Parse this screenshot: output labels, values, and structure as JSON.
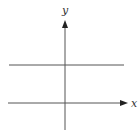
{
  "diagram": {
    "type": "coordinate-plane",
    "axes": {
      "x_label": "x",
      "y_label": "y",
      "origin": {
        "px": 65,
        "py": 103
      },
      "x_axis": {
        "start": 8,
        "end": 127
      },
      "y_axis": {
        "top": 20,
        "bottom": 130
      }
    },
    "lines": [
      {
        "name": "horizontal-line",
        "kind": "horizontal",
        "y_px": 65,
        "x_start_px": 9,
        "x_end_px": 124
      }
    ],
    "colors": {
      "line": "#555555",
      "arrow": "#222222",
      "label": "#333333",
      "background": "#ffffff"
    }
  }
}
